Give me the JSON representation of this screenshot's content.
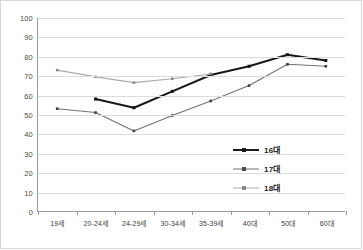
{
  "chart_data": {
    "type": "line",
    "title": "",
    "subtitle": "",
    "xlabel": "",
    "ylabel": "",
    "ylim": [
      0,
      100
    ],
    "ytick_step": 10,
    "yticks": [
      "0",
      "10",
      "20",
      "30",
      "40",
      "50",
      "60",
      "70",
      "80",
      "90",
      "100"
    ],
    "grid": "horizontal",
    "legend_position": "inside-right",
    "categories": [
      "19세",
      "20-24세",
      "24-29세",
      "30-34세",
      "35-39세",
      "40대",
      "50대",
      "60대"
    ],
    "series": [
      {
        "name": "16대",
        "color": "#1a1a1a",
        "width": 2.1,
        "values": [
          null,
          58,
          53.5,
          62,
          70.5,
          75,
          81,
          78
        ]
      },
      {
        "name": "17대",
        "color": "#737373",
        "width": 1.1,
        "values": [
          53,
          51,
          41.5,
          49.5,
          57,
          65,
          76,
          75
        ]
      },
      {
        "name": "18대",
        "color": "#aaaaaa",
        "width": 1.1,
        "values": [
          73,
          69.5,
          66.5,
          68.5,
          71,
          null,
          null,
          null
        ]
      }
    ]
  },
  "legend": {
    "items": [
      {
        "label": "16대",
        "color": "#1a1a1a",
        "width": 2.1
      },
      {
        "label": "17대",
        "color": "#737373",
        "width": 1.1
      },
      {
        "label": "18대",
        "color": "#aaaaaa",
        "width": 1.1
      }
    ]
  },
  "colors": {
    "axis": "#9a9a9a",
    "grid": "#dcdcdc",
    "frame": "#d8d8d8",
    "background": "#ffffff",
    "tick_text": "#4a4a4a"
  }
}
